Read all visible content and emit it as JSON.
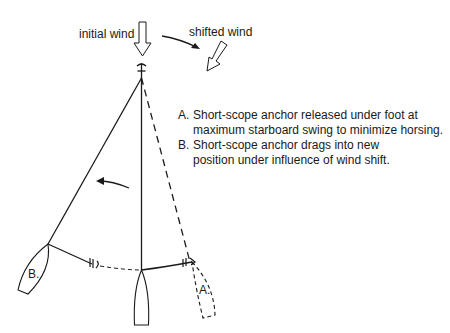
{
  "labels": {
    "initial_wind": "initial wind",
    "shifted_wind": "shifted wind",
    "boat_a": "A.",
    "boat_b": "B."
  },
  "notes": [
    {
      "key": "A.",
      "text": "Short-scope anchor released under foot at\nmaximum starboard swing to minimize horsing."
    },
    {
      "key": "B.",
      "text": "Short-scope anchor drags into new\nposition under influence of wind shift."
    }
  ],
  "colors": {
    "line": "#1a1a1a",
    "background": "#ffffff"
  }
}
